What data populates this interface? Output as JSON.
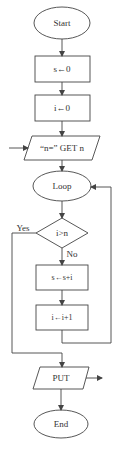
{
  "colors": {
    "stroke": "#444444",
    "text": "#333333",
    "background": "#ffffff"
  },
  "flowchart": {
    "nodes": [
      {
        "id": "start",
        "type": "terminal",
        "label": "Start"
      },
      {
        "id": "init_s",
        "type": "process",
        "label": "s←0"
      },
      {
        "id": "init_i",
        "type": "process",
        "label": "i←0"
      },
      {
        "id": "input_n",
        "type": "io",
        "label": "“n=”  GET n"
      },
      {
        "id": "loop",
        "type": "terminal",
        "label": "Loop"
      },
      {
        "id": "cond",
        "type": "decision",
        "label": "i>n"
      },
      {
        "id": "add",
        "type": "process",
        "label": "s←s+i"
      },
      {
        "id": "inc",
        "type": "process",
        "label": "i←i+1"
      },
      {
        "id": "output",
        "type": "io",
        "label": "PUT"
      },
      {
        "id": "end",
        "type": "terminal",
        "label": "End"
      }
    ],
    "edge_labels": {
      "yes": "Yes",
      "no": "No"
    }
  }
}
